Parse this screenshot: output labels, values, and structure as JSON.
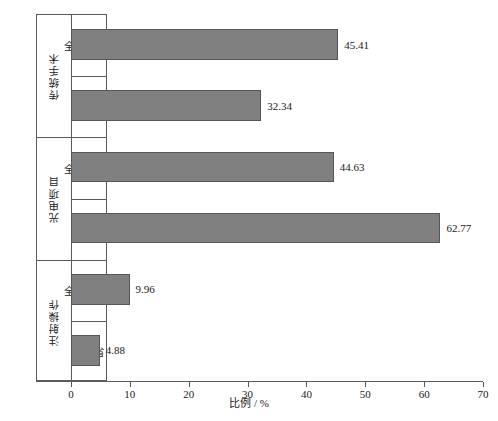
{
  "chart_data": {
    "type": "bar",
    "orientation": "horizontal",
    "title": "",
    "xlabel": "比例 / %",
    "ylabel": "",
    "xlim": [
      0,
      70
    ],
    "xticks": [
      0,
      10,
      20,
      30,
      40,
      50,
      60,
      70
    ],
    "xtick_labels": [
      "0",
      "10",
      "20",
      "30",
      "40",
      "50",
      "60",
      "70"
    ],
    "grid": false,
    "legend": false,
    "bar_color": "#808080",
    "bar_edge_color": "#565656",
    "axis_color": "#5a5a5a",
    "groups": [
      {
        "label": "传统手术",
        "categories": [
          "全国均值",
          "江西省"
        ],
        "values": [
          45.41,
          32.34
        ],
        "value_labels": [
          "45.41",
          "32.34"
        ]
      },
      {
        "label": "光电项目",
        "categories": [
          "全国均值",
          "江西省"
        ],
        "values": [
          44.63,
          62.77
        ],
        "value_labels": [
          "44.63",
          "62.77"
        ]
      },
      {
        "label": "注射操作",
        "categories": [
          "全国均值",
          "江西省"
        ],
        "values": [
          9.96,
          4.88
        ],
        "value_labels": [
          "9.96",
          "4.88"
        ]
      }
    ],
    "bars": [
      {
        "group": "传统手术",
        "category": "全国均值",
        "value": 45.41,
        "label": "45.41"
      },
      {
        "group": "传统手术",
        "category": "江西省",
        "value": 32.34,
        "label": "32.34"
      },
      {
        "group": "光电项目",
        "category": "全国均值",
        "value": 44.63,
        "label": "44.63"
      },
      {
        "group": "光电项目",
        "category": "江西省",
        "value": 62.77,
        "label": "62.77"
      },
      {
        "group": "注射操作",
        "category": "全国均值",
        "value": 9.96,
        "label": "9.96"
      },
      {
        "group": "注射操作",
        "category": "江西省",
        "value": 4.88,
        "label": "4.88"
      }
    ]
  }
}
